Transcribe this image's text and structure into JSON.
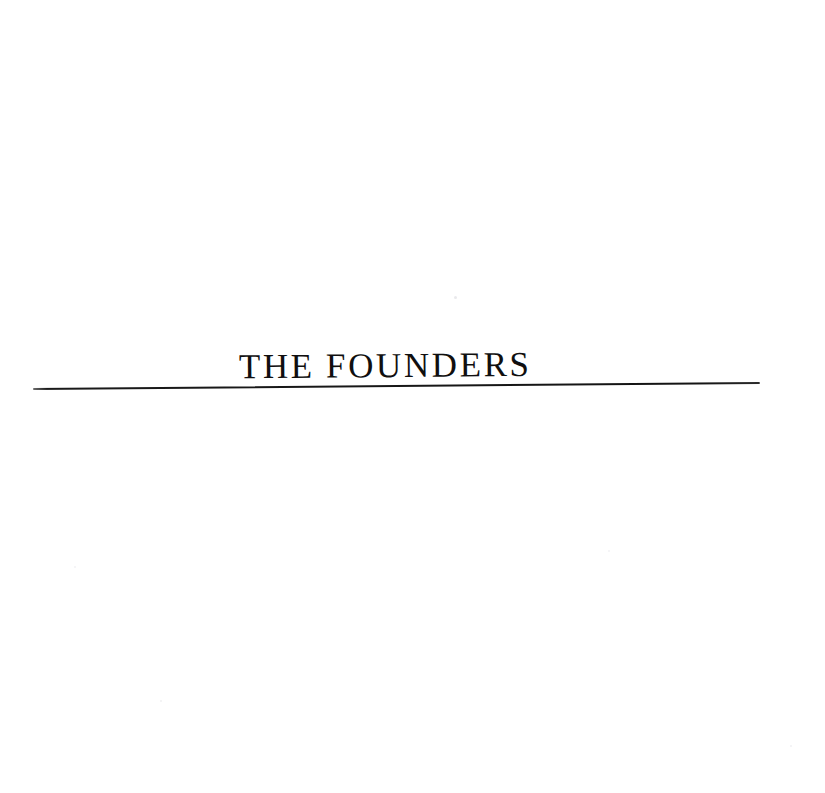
{
  "document": {
    "kind": "scanned-book-page",
    "page_background_color": "#ffffff",
    "ink_color": "#100f0f"
  },
  "section_title": {
    "text": "THE FOUNDERS",
    "style": "serif-capitals",
    "color": "#100f0f"
  },
  "divider": {
    "name": "horizontal-rule",
    "color": "#141414"
  },
  "artifacts": {
    "speck_a": "",
    "speck_b": "",
    "speck_c": "",
    "speck_d": "",
    "speck_e": ""
  }
}
